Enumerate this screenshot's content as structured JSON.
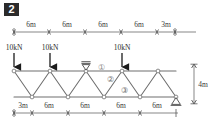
{
  "problem": {
    "number": "2"
  },
  "figure": {
    "height_label": "4m",
    "top_dimensions": [
      "6m",
      "6m",
      "6m",
      "6m",
      "3m"
    ],
    "bottom_dimensions": [
      "3m",
      "6m",
      "6m",
      "6m",
      "6m"
    ],
    "loads": [
      {
        "label": "10kN",
        "at_node": "T0"
      },
      {
        "label": "10kN",
        "at_node": "T1"
      },
      {
        "label": "10kN",
        "at_node": "T3"
      }
    ],
    "member_labels": [
      "①",
      "②",
      "③"
    ],
    "supports": [
      {
        "type": "roller-support",
        "location": "top-chord-node-T2"
      },
      {
        "type": "pin-support",
        "location": "bottom-chord-node-B4"
      }
    ],
    "colors": {
      "line": "#555555",
      "chord": "#6e6e6e",
      "text": "#3a3a3a",
      "badge_bg": "#2b2b2b",
      "badge_fg": "#ffffff",
      "node_fill": "#ffffff"
    }
  }
}
